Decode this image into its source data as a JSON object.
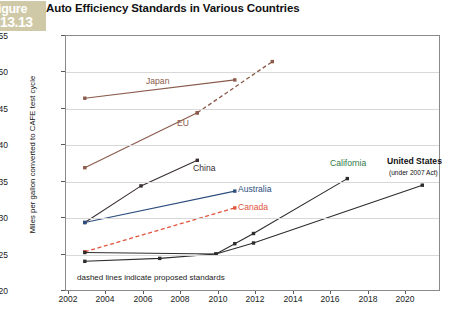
{
  "figure": {
    "word": "igure",
    "number": "13.13"
  },
  "title": "Auto Efficiency Standards in Various Countries",
  "chart_data": {
    "type": "line",
    "title": "Auto Efficiency Standards in Various Countries",
    "xlabel": "",
    "ylabel": "Miles per gallon converted to CAFE test cycle",
    "xlim": [
      2001,
      2021
    ],
    "ylim": [
      20,
      55
    ],
    "yticks": [
      20,
      25,
      30,
      35,
      40,
      45,
      50,
      55
    ],
    "xticks": [
      2002,
      2004,
      2006,
      2008,
      2010,
      2012,
      2014,
      2016,
      2018,
      2020
    ],
    "grid": true,
    "legend": "inline-labels",
    "annotation": "dashed lines indicate proposed standards",
    "series": [
      {
        "name": "Japan",
        "color": "#8a5a4a",
        "label_color": "#8a5a4a",
        "solid": [
          [
            2002,
            46.5
          ],
          [
            2010,
            49.0
          ]
        ],
        "dashed": []
      },
      {
        "name": "EU",
        "color": "#8a5a4a",
        "label_color": "#8a5a4a",
        "solid": [
          [
            2002,
            37.0
          ],
          [
            2008,
            44.5
          ]
        ],
        "dashed": [
          [
            2008,
            44.5
          ],
          [
            2012,
            51.5
          ]
        ]
      },
      {
        "name": "China",
        "color": "#3a2e33",
        "label_color": "#3a2e33",
        "solid": [
          [
            2002,
            29.5
          ],
          [
            2005,
            34.5
          ],
          [
            2008,
            38.0
          ]
        ],
        "dashed": []
      },
      {
        "name": "Australia",
        "color": "#2c4d7e",
        "label_color": "#2c4d7e",
        "solid": [
          [
            2002,
            29.5
          ],
          [
            2010,
            33.8
          ]
        ],
        "dashed": []
      },
      {
        "name": "Canada",
        "color": "#e0553c",
        "label_color": "#e0553c",
        "solid": [],
        "dashed": [
          [
            2002,
            25.5
          ],
          [
            2010,
            31.5
          ]
        ]
      },
      {
        "name": "California",
        "color": "#2d2d2d",
        "label_color": "#2f7a4a",
        "solid": [
          [
            2002,
            25.4
          ],
          [
            2009,
            25.2
          ],
          [
            2010,
            26.6
          ],
          [
            2011,
            28.0
          ],
          [
            2016,
            35.5
          ]
        ],
        "dashed": []
      },
      {
        "name": "United States",
        "color": "#2d2d2d",
        "label_color": "#111111",
        "sublabel": "(under 2007 Act)",
        "solid": [
          [
            2002,
            24.2
          ],
          [
            2006,
            24.6
          ],
          [
            2009,
            25.2
          ],
          [
            2011,
            26.7
          ],
          [
            2020,
            34.6
          ]
        ],
        "dashed": []
      }
    ]
  },
  "labels": {
    "japan": "Japan",
    "eu": "EU",
    "china": "China",
    "australia": "Australia",
    "canada": "Canada",
    "california": "California",
    "united_states": "United States",
    "united_states_sub": "(under 2007 Act)"
  },
  "axis": {
    "y_title": "Miles per gallon converted to CAFE test cycle",
    "y_20": "20",
    "y_25": "25",
    "y_30": "30",
    "y_35": "35",
    "y_40": "40",
    "y_45": "45",
    "y_50": "50",
    "y_55": "55",
    "x_2002": "2002",
    "x_2004": "2004",
    "x_2006": "2006",
    "x_2008": "2008",
    "x_2010": "2010",
    "x_2012": "2012",
    "x_2014": "2014",
    "x_2016": "2016",
    "x_2018": "2018",
    "x_2020": "2020"
  },
  "note": "dashed lines indicate proposed standards",
  "bottom_caption": ""
}
